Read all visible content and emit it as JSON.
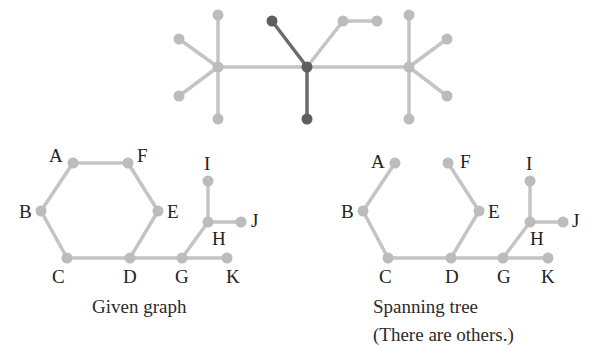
{
  "colors": {
    "edge_light": "#c4c4c4",
    "node_light": "#bcbcbc",
    "edge_dark": "#6b6b6b",
    "node_dark": "#5e5e5e",
    "text": "#222222"
  },
  "top_graph": {
    "nodes": [
      {
        "id": "L",
        "x": 218,
        "y": 67,
        "dark": false
      },
      {
        "id": "L1",
        "x": 218,
        "y": 15,
        "dark": false
      },
      {
        "id": "L2",
        "x": 179,
        "y": 39,
        "dark": false
      },
      {
        "id": "L3",
        "x": 179,
        "y": 96,
        "dark": false
      },
      {
        "id": "L4",
        "x": 218,
        "y": 119,
        "dark": false
      },
      {
        "id": "M",
        "x": 307,
        "y": 67,
        "dark": true
      },
      {
        "id": "M1",
        "x": 272,
        "y": 21,
        "dark": true
      },
      {
        "id": "M2",
        "x": 307,
        "y": 119,
        "dark": true
      },
      {
        "id": "M3",
        "x": 343,
        "y": 21,
        "dark": false
      },
      {
        "id": "M4",
        "x": 377,
        "y": 21,
        "dark": false
      },
      {
        "id": "R",
        "x": 409,
        "y": 67,
        "dark": false
      },
      {
        "id": "R1",
        "x": 409,
        "y": 15,
        "dark": false
      },
      {
        "id": "R2",
        "x": 447,
        "y": 39,
        "dark": false
      },
      {
        "id": "R3",
        "x": 447,
        "y": 96,
        "dark": false
      },
      {
        "id": "R4",
        "x": 409,
        "y": 119,
        "dark": false
      }
    ],
    "edges": [
      {
        "from": "L",
        "to": "L1",
        "dark": false
      },
      {
        "from": "L",
        "to": "L2",
        "dark": false
      },
      {
        "from": "L",
        "to": "L3",
        "dark": false
      },
      {
        "from": "L",
        "to": "L4",
        "dark": false
      },
      {
        "from": "L",
        "to": "M",
        "dark": false
      },
      {
        "from": "M",
        "to": "M1",
        "dark": true
      },
      {
        "from": "M",
        "to": "M2",
        "dark": true
      },
      {
        "from": "M",
        "to": "M3",
        "dark": false
      },
      {
        "from": "M3",
        "to": "M4",
        "dark": false
      },
      {
        "from": "M",
        "to": "R",
        "dark": false
      },
      {
        "from": "R",
        "to": "R1",
        "dark": false
      },
      {
        "from": "R",
        "to": "R2",
        "dark": false
      },
      {
        "from": "R",
        "to": "R3",
        "dark": false
      },
      {
        "from": "R",
        "to": "R4",
        "dark": false
      }
    ]
  },
  "given_graph": {
    "caption": "Given graph",
    "nodes": [
      {
        "id": "A",
        "label": "A",
        "x": 73,
        "y": 163,
        "lx": 49,
        "ly": 162
      },
      {
        "id": "F",
        "label": "F",
        "x": 128,
        "y": 163,
        "lx": 137,
        "ly": 162
      },
      {
        "id": "B",
        "label": "B",
        "x": 41,
        "y": 211,
        "lx": 19,
        "ly": 218
      },
      {
        "id": "E",
        "label": "E",
        "x": 158,
        "y": 211,
        "lx": 167,
        "ly": 218
      },
      {
        "id": "C",
        "label": "C",
        "x": 67,
        "y": 258,
        "lx": 52,
        "ly": 283
      },
      {
        "id": "D",
        "label": "D",
        "x": 130,
        "y": 258,
        "lx": 123,
        "ly": 283
      },
      {
        "id": "G",
        "label": "G",
        "x": 182,
        "y": 258,
        "lx": 175,
        "ly": 283
      },
      {
        "id": "K",
        "label": "K",
        "x": 227,
        "y": 258,
        "lx": 226,
        "ly": 283
      },
      {
        "id": "H",
        "label": "H",
        "x": 208,
        "y": 222,
        "lx": 212,
        "ly": 245
      },
      {
        "id": "I",
        "label": "I",
        "x": 208,
        "y": 181,
        "lx": 204,
        "ly": 170
      },
      {
        "id": "J",
        "label": "J",
        "x": 241,
        "y": 222,
        "lx": 251,
        "ly": 227
      }
    ],
    "edges": [
      [
        "A",
        "F"
      ],
      [
        "A",
        "B"
      ],
      [
        "B",
        "C"
      ],
      [
        "C",
        "D"
      ],
      [
        "D",
        "E"
      ],
      [
        "E",
        "F"
      ],
      [
        "D",
        "G"
      ],
      [
        "G",
        "K"
      ],
      [
        "G",
        "H"
      ],
      [
        "H",
        "I"
      ],
      [
        "H",
        "J"
      ]
    ]
  },
  "spanning_tree": {
    "caption_line1": "Spanning tree",
    "caption_line2": "(There are others.)",
    "nodes": [
      {
        "id": "A",
        "label": "A",
        "x": 395,
        "y": 163,
        "lx": 371,
        "ly": 168
      },
      {
        "id": "F",
        "label": "F",
        "x": 448,
        "y": 163,
        "lx": 460,
        "ly": 168
      },
      {
        "id": "B",
        "label": "B",
        "x": 363,
        "y": 211,
        "lx": 341,
        "ly": 218
      },
      {
        "id": "E",
        "label": "E",
        "x": 479,
        "y": 211,
        "lx": 488,
        "ly": 218
      },
      {
        "id": "C",
        "label": "C",
        "x": 388,
        "y": 258,
        "lx": 379,
        "ly": 283
      },
      {
        "id": "D",
        "label": "D",
        "x": 451,
        "y": 258,
        "lx": 445,
        "ly": 283
      },
      {
        "id": "G",
        "label": "G",
        "x": 503,
        "y": 258,
        "lx": 497,
        "ly": 283
      },
      {
        "id": "K",
        "label": "K",
        "x": 548,
        "y": 258,
        "lx": 541,
        "ly": 283
      },
      {
        "id": "H",
        "label": "H",
        "x": 530,
        "y": 222,
        "lx": 530,
        "ly": 245
      },
      {
        "id": "I",
        "label": "I",
        "x": 530,
        "y": 181,
        "lx": 526,
        "ly": 170
      },
      {
        "id": "J",
        "label": "J",
        "x": 563,
        "y": 222,
        "lx": 572,
        "ly": 227
      }
    ],
    "edges": [
      [
        "A",
        "B"
      ],
      [
        "B",
        "C"
      ],
      [
        "C",
        "D"
      ],
      [
        "D",
        "E"
      ],
      [
        "E",
        "F"
      ],
      [
        "D",
        "G"
      ],
      [
        "G",
        "K"
      ],
      [
        "G",
        "H"
      ],
      [
        "H",
        "I"
      ],
      [
        "H",
        "J"
      ]
    ]
  }
}
